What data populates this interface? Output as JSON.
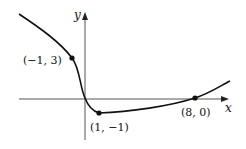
{
  "figure": {
    "type": "function-graph",
    "axes": {
      "x_label": "x",
      "y_label": "y"
    },
    "points": [
      {
        "label": "(−1, 3)",
        "x": -1,
        "y": 3
      },
      {
        "label": "(1, −1)",
        "x": 1,
        "y": -1
      },
      {
        "label": "(8, 0)",
        "x": 8,
        "y": 0
      }
    ],
    "colors": {
      "curve": "#111111",
      "axes": "#555555",
      "background": "#ffffff"
    }
  }
}
